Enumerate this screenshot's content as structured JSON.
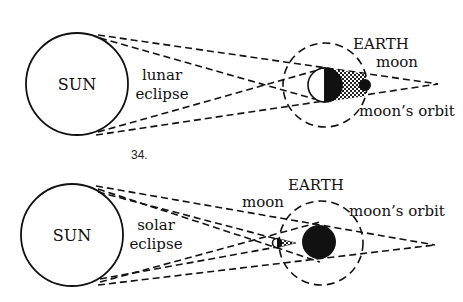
{
  "figures": [
    {
      "number": "33.",
      "title": "lunar eclipse",
      "labels": {
        "sun": "SUN",
        "eclipse_line1": "lunar",
        "eclipse_line2": "eclipse",
        "earth": "EARTH",
        "moon": "moon",
        "orbit": "moon’s orbit"
      }
    },
    {
      "number": "34.",
      "title": "solar eclipse",
      "labels": {
        "sun": "SUN",
        "eclipse_line1": "solar",
        "eclipse_line2": "eclipse",
        "earth": "EARTH",
        "moon": "moon",
        "orbit": "moon’s orbit"
      }
    }
  ],
  "colors": {
    "ink": "#111111",
    "background": "#ffffff"
  }
}
